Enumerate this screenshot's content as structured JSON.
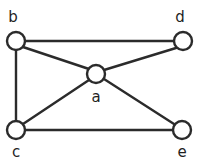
{
  "figure": {
    "width": 201,
    "height": 162,
    "background_color": "#ffffff",
    "stroke_color": "#2b2b2b",
    "node_fill_color": "#ffffff",
    "label_color": "#1f1f1f",
    "node_radius": 9,
    "stroke_width": 2.4
  },
  "nodes": [
    {
      "id": "b",
      "label": "b",
      "cx": 16,
      "cy": 41,
      "label_x": 13,
      "label_y": 17
    },
    {
      "id": "d",
      "label": "d",
      "cx": 183,
      "cy": 41,
      "label_x": 180,
      "label_y": 17
    },
    {
      "id": "a",
      "label": "a",
      "cx": 96,
      "cy": 74,
      "label_x": 96,
      "label_y": 97
    },
    {
      "id": "c",
      "label": "c",
      "cx": 16,
      "cy": 130,
      "label_x": 16,
      "label_y": 152
    },
    {
      "id": "e",
      "label": "e",
      "cx": 182,
      "cy": 130,
      "label_x": 182,
      "label_y": 152
    }
  ],
  "edges": [
    {
      "id": "b-d",
      "from": "b",
      "to": "d",
      "x1": 25,
      "y1": 41,
      "x2": 174,
      "y2": 41
    },
    {
      "id": "b-c",
      "from": "b",
      "to": "c",
      "x1": 16,
      "y1": 50,
      "x2": 16,
      "y2": 121
    },
    {
      "id": "b-a",
      "from": "b",
      "to": "a",
      "x1": 23,
      "y1": 47,
      "x2": 89,
      "y2": 69
    },
    {
      "id": "c-a",
      "from": "c",
      "to": "a",
      "x1": 23,
      "y1": 124,
      "x2": 89,
      "y2": 80
    },
    {
      "id": "c-e",
      "from": "c",
      "to": "e",
      "x1": 25,
      "y1": 130,
      "x2": 173,
      "y2": 130
    },
    {
      "id": "a-d",
      "from": "a",
      "to": "d",
      "x1": 104,
      "y1": 70,
      "x2": 176,
      "y2": 48
    },
    {
      "id": "a-e",
      "from": "a",
      "to": "e",
      "x1": 104,
      "y1": 79,
      "x2": 174,
      "y2": 124
    }
  ]
}
